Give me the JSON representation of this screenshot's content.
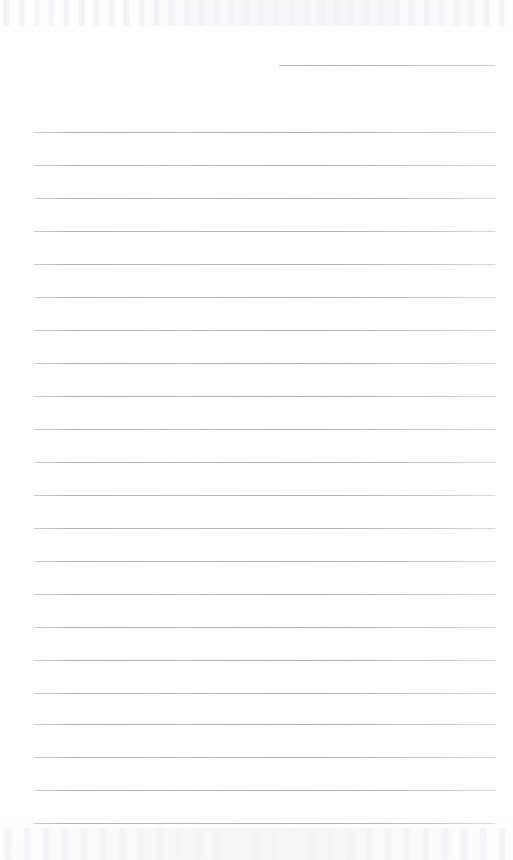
{
  "document": {
    "kind": "scanned-ruled-page",
    "title": "Blank ruled notebook page",
    "page_width": 513,
    "page_height": 860,
    "background_color": "#ffffff",
    "rule_color": "#b4b4bc",
    "rule_thickness_px": 1,
    "rule_left_x": 34,
    "rule_right_x": 495,
    "rule_spacing_px": 33,
    "text_content": "",
    "handwriting_present": "no",
    "printed_text_present": "no"
  },
  "artifacts": {
    "top_band_label": "faint scan speckle band",
    "bottom_band_label": "faint scan speckle band",
    "top_band_y": 0,
    "top_band_height": 26,
    "bottom_band_y": 828,
    "bottom_band_height": 32
  },
  "rules": [
    {
      "id": "rule-short-1",
      "y": 65,
      "x1": 279,
      "x2": 495,
      "full_width": false
    },
    {
      "id": "rule-1",
      "y": 132,
      "x1": 34,
      "x2": 495,
      "full_width": true
    },
    {
      "id": "rule-2",
      "y": 165,
      "x1": 34,
      "x2": 495,
      "full_width": true
    },
    {
      "id": "rule-3",
      "y": 198,
      "x1": 34,
      "x2": 495,
      "full_width": true
    },
    {
      "id": "rule-4",
      "y": 231,
      "x1": 34,
      "x2": 495,
      "full_width": true
    },
    {
      "id": "rule-5",
      "y": 264,
      "x1": 34,
      "x2": 495,
      "full_width": true
    },
    {
      "id": "rule-6",
      "y": 297,
      "x1": 34,
      "x2": 495,
      "full_width": true
    },
    {
      "id": "rule-7",
      "y": 330,
      "x1": 34,
      "x2": 495,
      "full_width": true
    },
    {
      "id": "rule-8",
      "y": 363,
      "x1": 34,
      "x2": 495,
      "full_width": true
    },
    {
      "id": "rule-9",
      "y": 396,
      "x1": 34,
      "x2": 495,
      "full_width": true
    },
    {
      "id": "rule-10",
      "y": 429,
      "x1": 34,
      "x2": 495,
      "full_width": true
    },
    {
      "id": "rule-11",
      "y": 462,
      "x1": 34,
      "x2": 495,
      "full_width": true
    },
    {
      "id": "rule-12",
      "y": 495,
      "x1": 34,
      "x2": 495,
      "full_width": true
    },
    {
      "id": "rule-13",
      "y": 528,
      "x1": 34,
      "x2": 495,
      "full_width": true
    },
    {
      "id": "rule-14",
      "y": 561,
      "x1": 34,
      "x2": 495,
      "full_width": true
    },
    {
      "id": "rule-15",
      "y": 594,
      "x1": 34,
      "x2": 495,
      "full_width": true
    },
    {
      "id": "rule-16",
      "y": 627,
      "x1": 34,
      "x2": 495,
      "full_width": true
    },
    {
      "id": "rule-17",
      "y": 660,
      "x1": 34,
      "x2": 495,
      "full_width": true
    },
    {
      "id": "rule-18",
      "y": 693,
      "x1": 34,
      "x2": 495,
      "full_width": true
    },
    {
      "id": "rule-19",
      "y": 724,
      "x1": 34,
      "x2": 495,
      "full_width": true
    },
    {
      "id": "rule-20",
      "y": 757,
      "x1": 34,
      "x2": 495,
      "full_width": true
    },
    {
      "id": "rule-21",
      "y": 790,
      "x1": 34,
      "x2": 495,
      "full_width": true
    },
    {
      "id": "rule-22",
      "y": 823,
      "x1": 34,
      "x2": 495,
      "full_width": true
    }
  ]
}
